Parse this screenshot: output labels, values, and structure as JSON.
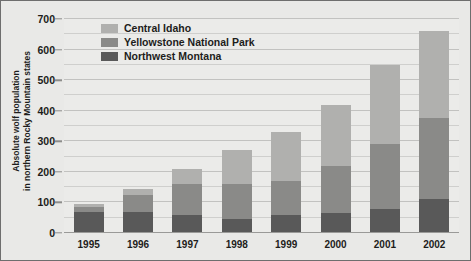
{
  "chart_data": {
    "type": "bar",
    "stacked": true,
    "title": "",
    "xlabel": "",
    "ylabel": "Absolute wolf population in northern Rocky Mountain states",
    "ylabel_line1": "Absolute wolf population",
    "ylabel_line2": "in northern Rocky Mountain states",
    "categories": [
      "1995",
      "1996",
      "1997",
      "1998",
      "1999",
      "2000",
      "2001",
      "2002"
    ],
    "series": [
      {
        "name": "Northwest Montana",
        "color": "#595959",
        "values": [
          70,
          70,
          60,
          45,
          60,
          65,
          80,
          110
        ]
      },
      {
        "name": "Yellowstone National Park",
        "color": "#8a8a88",
        "values": [
          15,
          55,
          100,
          115,
          110,
          155,
          210,
          265
        ]
      },
      {
        "name": "Central Idaho",
        "color": "#b0b0ae",
        "values": [
          10,
          20,
          50,
          110,
          160,
          200,
          260,
          285
        ]
      }
    ],
    "totals": [
      95,
      145,
      210,
      270,
      330,
      420,
      550,
      660
    ],
    "ylim": [
      0,
      700
    ],
    "ytick_values": [
      0,
      100,
      200,
      300,
      400,
      500,
      600,
      700
    ],
    "ytick_labels": [
      "0",
      "100",
      "200",
      "300",
      "400",
      "500",
      "600",
      "700"
    ],
    "minor_gridline_step": 50,
    "grid": true,
    "legend_position": "top-left",
    "legend_entries": [
      {
        "label": "Central Idaho",
        "color": "#b0b0ae"
      },
      {
        "label": "Yellowstone National Park",
        "color": "#8a8a88"
      },
      {
        "label": "Northwest Montana",
        "color": "#595959"
      }
    ],
    "background_color": "#e9e9e7",
    "plot_background_color": "#ebebe9"
  }
}
